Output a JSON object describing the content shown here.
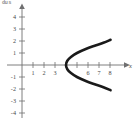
{
  "figure": {
    "corner_tag": "du s",
    "background_color": "#ffffff",
    "curve_color": "#1a1a1a",
    "axis_color": "#6f6f70"
  },
  "chart_data": {
    "type": "line",
    "title": "",
    "subtitle": "",
    "xlabel": "x",
    "ylabel": "y",
    "grid": false,
    "legend": null,
    "xlim": [
      -1.2,
      9.2
    ],
    "ylim": [
      -4.7,
      4.7
    ],
    "x_ticks": [
      1,
      2,
      3,
      4,
      5,
      6,
      7,
      8
    ],
    "x_tick_labels": [
      "1",
      "2",
      "3",
      "",
      "",
      "6",
      "7",
      "8"
    ],
    "y_ticks": [
      -4,
      -3,
      -2,
      -1,
      1,
      2,
      3,
      4
    ],
    "y_tick_labels": [
      "-4",
      "-3",
      "-2",
      "-1",
      "1",
      "2",
      "3",
      "4"
    ],
    "origin_label": "",
    "annotations": [],
    "series": [
      {
        "name": "sideways parabola",
        "equation": "x = y^2 + 4",
        "vertex": [
          4,
          0
        ],
        "opens": "right",
        "points": [
          [
            8.05,
            -2.1
          ],
          [
            7.4,
            -1.85
          ],
          [
            6.6,
            -1.6
          ],
          [
            5.8,
            -1.33
          ],
          [
            5.0,
            -1.0
          ],
          [
            4.45,
            -0.67
          ],
          [
            4.12,
            -0.35
          ],
          [
            4.0,
            0
          ],
          [
            4.12,
            0.35
          ],
          [
            4.45,
            0.67
          ],
          [
            5.0,
            1.0
          ],
          [
            5.8,
            1.33
          ],
          [
            6.6,
            1.6
          ],
          [
            7.4,
            1.85
          ],
          [
            8.05,
            2.1
          ]
        ]
      }
    ]
  }
}
